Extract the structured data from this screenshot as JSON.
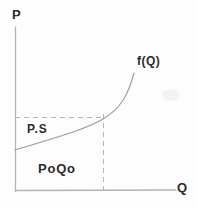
{
  "figure": {
    "axes": {
      "y_label": "P",
      "x_label": "Q"
    },
    "curve": {
      "label": "f(Q)"
    },
    "regions": {
      "producer_surplus_label": "P.S",
      "rectangle_label": "PoQo"
    },
    "colors": {
      "background": "#fdfdfd",
      "axis": "#b4b4b4",
      "dashed_guides": "#b6b6b6",
      "curve": "#9c9c9c",
      "text": "#2b2b2b"
    }
  }
}
